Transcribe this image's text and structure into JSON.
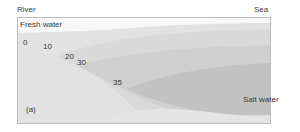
{
  "labels": {
    "river": "River",
    "sea": "Sea",
    "fresh_water": "Fresh water",
    "salt_water": "Salt water",
    "panel": "(a)"
  },
  "isohalines": [
    {
      "value": "0"
    },
    {
      "value": "10"
    },
    {
      "value": "20"
    },
    {
      "value": "30"
    },
    {
      "value": "35"
    }
  ],
  "colors": {
    "fresh": "#f7f7f7",
    "background": "#e6e6e6",
    "layer_10": "#e0e0e0",
    "layer_20": "#d4d4d4",
    "layer_30": "#c9c9c9",
    "layer_35": "#bcbcbc",
    "frame": "#bdbdbd"
  }
}
